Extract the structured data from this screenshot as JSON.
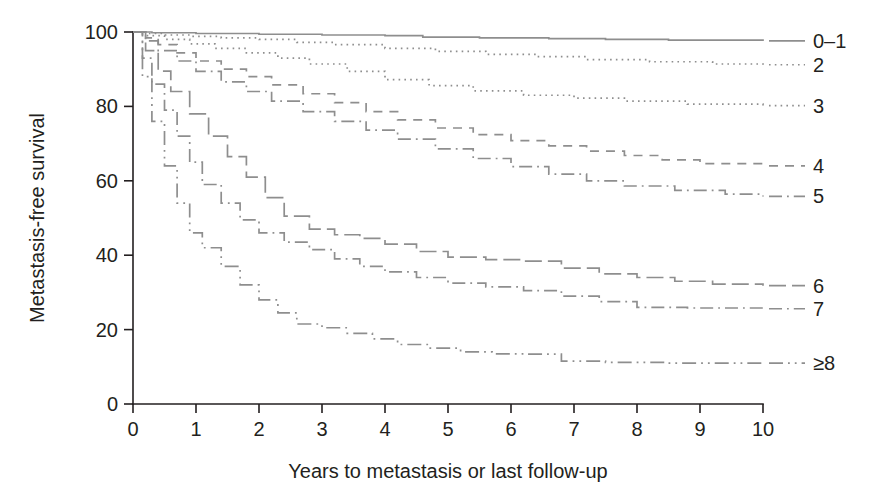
{
  "figure": {
    "background": "#ffffff",
    "line_color": "#8e8e8e",
    "text_color": "#231f20"
  },
  "axes": {
    "x_title": "Years to metastasis or last follow-up",
    "y_title": "Metastasis-free survival",
    "x_ticks": [
      "0",
      "1",
      "2",
      "3",
      "4",
      "5",
      "6",
      "7",
      "8",
      "9",
      "10"
    ],
    "y_ticks": [
      "0",
      "20",
      "40",
      "60",
      "80",
      "100"
    ]
  },
  "legend": {
    "entries": [
      {
        "label": "0–1",
        "style": "solid"
      },
      {
        "label": "2",
        "style": "dotted"
      },
      {
        "label": "3",
        "style": "dotted"
      },
      {
        "label": "4",
        "style": "dashed"
      },
      {
        "label": "5",
        "style": "dash-dot"
      },
      {
        "label": "6",
        "style": "long-dash"
      },
      {
        "label": "7",
        "style": "dash-dot"
      },
      {
        "label": "≥8",
        "style": "dash-dot-dot"
      }
    ]
  },
  "chart_data": {
    "type": "line",
    "title": "",
    "xlabel": "Years to metastasis or last follow-up",
    "ylabel": "Metastasis-free survival",
    "xlim": [
      0,
      10
    ],
    "ylim": [
      0,
      100
    ],
    "xticks": [
      0,
      1,
      2,
      3,
      4,
      5,
      6,
      7,
      8,
      9,
      10
    ],
    "yticks": [
      0,
      20,
      40,
      60,
      80,
      100
    ],
    "grid": false,
    "legend_position": "right",
    "step": "post",
    "series": [
      {
        "name": "0–1",
        "dash": "solid",
        "x": [
          0,
          0.3,
          1.0,
          2.0,
          3.0,
          4.0,
          4.6,
          5.5,
          6.6,
          7.5,
          8.5,
          10.0
        ],
        "y": [
          100,
          99.8,
          99.6,
          99.4,
          99.2,
          99.0,
          98.6,
          98.4,
          98.2,
          98.0,
          97.8,
          97.6
        ]
      },
      {
        "name": "2",
        "dash": "dotted",
        "x": [
          0,
          0.2,
          0.5,
          0.9,
          1.4,
          2.0,
          2.6,
          3.2,
          4.0,
          4.8,
          5.6,
          6.4,
          7.2,
          8.2,
          9.2,
          10.0
        ],
        "y": [
          100,
          99.6,
          99.2,
          98.8,
          98.4,
          98.0,
          97.2,
          96.6,
          95.6,
          94.8,
          94.0,
          93.4,
          92.6,
          92.0,
          91.4,
          91.2
        ]
      },
      {
        "name": "3",
        "dash": "dotted",
        "x": [
          0,
          0.2,
          0.5,
          0.9,
          1.3,
          1.8,
          2.3,
          2.8,
          3.4,
          4.0,
          4.7,
          5.4,
          6.2,
          7.0,
          7.8,
          8.8,
          10.0
        ],
        "y": [
          100,
          99.0,
          98.0,
          96.8,
          95.6,
          94.4,
          93.0,
          91.4,
          89.4,
          87.2,
          85.6,
          84.2,
          83.0,
          82.2,
          81.4,
          80.6,
          80.2
        ]
      },
      {
        "name": "4",
        "dash": "dashed",
        "x": [
          0,
          0.2,
          0.4,
          0.7,
          1.0,
          1.4,
          1.8,
          2.2,
          2.7,
          3.2,
          3.7,
          4.2,
          4.8,
          5.4,
          6.0,
          6.6,
          7.2,
          7.8,
          8.4,
          9.0,
          10.0
        ],
        "y": [
          100,
          98.4,
          96.6,
          94.4,
          92.2,
          90.0,
          88.0,
          85.8,
          83.4,
          81.0,
          78.6,
          76.4,
          74.2,
          72.4,
          70.8,
          69.4,
          68.0,
          66.8,
          65.6,
          64.6,
          64.0
        ]
      },
      {
        "name": "5",
        "dash": "dash-dot",
        "x": [
          0,
          0.2,
          0.4,
          0.7,
          1.0,
          1.4,
          1.8,
          2.2,
          2.7,
          3.2,
          3.7,
          4.2,
          4.8,
          5.4,
          6.0,
          6.6,
          7.2,
          7.8,
          8.6,
          9.4,
          10.0
        ],
        "y": [
          100,
          97.6,
          95.0,
          92.2,
          89.4,
          86.6,
          84.0,
          81.4,
          78.6,
          76.0,
          73.6,
          71.2,
          68.6,
          66.0,
          63.8,
          61.8,
          60.0,
          58.6,
          57.4,
          56.4,
          55.8
        ]
      },
      {
        "name": "6",
        "dash": "long-dash",
        "x": [
          0,
          0.2,
          0.4,
          0.6,
          0.9,
          1.2,
          1.5,
          1.8,
          2.1,
          2.4,
          2.8,
          3.2,
          3.6,
          4.0,
          4.5,
          5.0,
          5.6,
          6.2,
          6.8,
          7.4,
          8.0,
          8.6,
          9.2,
          10.0
        ],
        "y": [
          100,
          95.0,
          89.5,
          84.0,
          78.0,
          72.0,
          66.5,
          61.0,
          55.5,
          50.5,
          47.0,
          45.5,
          44.5,
          43.0,
          41.0,
          39.5,
          38.8,
          38.4,
          36.5,
          35.0,
          34.0,
          33.0,
          32.2,
          31.8
        ]
      },
      {
        "name": "7",
        "dash": "dash-dot",
        "x": [
          0,
          0.15,
          0.3,
          0.5,
          0.7,
          0.9,
          1.1,
          1.4,
          1.7,
          2.0,
          2.4,
          2.8,
          3.2,
          3.6,
          4.0,
          4.5,
          5.0,
          5.6,
          6.2,
          6.8,
          7.4,
          8.0,
          8.8,
          10.0
        ],
        "y": [
          100,
          93.0,
          86.0,
          79.0,
          72.0,
          65.0,
          59.0,
          54.0,
          49.5,
          46.0,
          43.5,
          41.5,
          39.0,
          37.0,
          35.5,
          34.0,
          32.5,
          31.5,
          30.5,
          29.0,
          27.5,
          26.0,
          25.8,
          25.6
        ]
      },
      {
        "name": "≥8",
        "dash": "dash-dot-dot",
        "x": [
          0,
          0.15,
          0.3,
          0.5,
          0.7,
          0.9,
          1.1,
          1.4,
          1.7,
          2.0,
          2.3,
          2.6,
          3.0,
          3.4,
          3.8,
          4.2,
          4.7,
          5.2,
          5.7,
          6.2,
          6.8,
          7.5,
          8.5,
          10.0
        ],
        "y": [
          100,
          88.0,
          76.0,
          64.0,
          54.0,
          46.0,
          42.0,
          37.0,
          32.0,
          28.0,
          24.5,
          21.5,
          20.5,
          19.0,
          17.5,
          16.0,
          15.0,
          14.0,
          13.5,
          13.4,
          11.5,
          11.2,
          11.0,
          11.0
        ]
      }
    ]
  }
}
